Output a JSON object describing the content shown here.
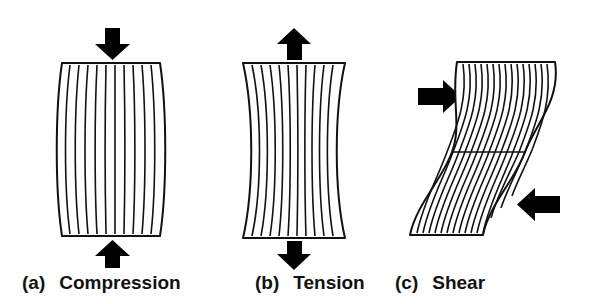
{
  "figure": {
    "background_color": "#ffffff",
    "stroke_color": "#111111",
    "arrow_color": "#000000",
    "width": 595,
    "height": 304
  },
  "panels": [
    {
      "id": "a",
      "tag": "(a)",
      "label": "Compression",
      "deformation": "barrel",
      "description": "Block bulges outward at mid-height; vertical grid lines bow outward.",
      "arrows": [
        {
          "name": "top-arrow",
          "direction": "down",
          "position": "top-center"
        },
        {
          "name": "bottom-arrow",
          "direction": "up",
          "position": "bottom-center"
        }
      ],
      "grid_line_count": 11,
      "geometry": {
        "top_y": 63,
        "bottom_y": 236,
        "top_left_x": 62,
        "top_right_x": 160,
        "bulge_px": 8
      }
    },
    {
      "id": "b",
      "tag": "(b)",
      "label": "Tension",
      "deformation": "necked",
      "description": "Block necks inward at mid-height; vertical grid lines pinch inward.",
      "arrows": [
        {
          "name": "top-arrow",
          "direction": "up",
          "position": "top-center"
        },
        {
          "name": "bottom-arrow",
          "direction": "down",
          "position": "bottom-center"
        }
      ],
      "grid_line_count": 11,
      "geometry": {
        "top_y": 63,
        "bottom_y": 238,
        "top_left_x": 33,
        "top_right_x": 135,
        "neck_px": 14
      }
    },
    {
      "id": "c",
      "tag": "(c)",
      "label": "Shear",
      "deformation": "sheared-s-curve",
      "description": "Block is sheared into an S shape with a horizontal mid-plane line; grid lines follow the S curve.",
      "arrows": [
        {
          "name": "upper-arrow",
          "direction": "right",
          "position": "upper-left"
        },
        {
          "name": "lower-arrow",
          "direction": "left",
          "position": "lower-right"
        }
      ],
      "grid_line_count": 16,
      "has_mid_line": true,
      "geometry": {
        "top_y": 62,
        "bottom_y": 235,
        "mid_line_y": 152,
        "top_left_x": 72,
        "top_right_x": 170,
        "bottom_left_x": 25,
        "bottom_right_x": 123,
        "shear_offset_px": 47
      }
    }
  ]
}
